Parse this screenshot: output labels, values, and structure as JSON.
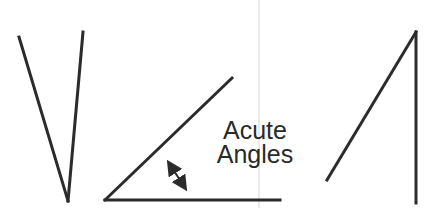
{
  "diagram": {
    "title_lines": [
      "Acute",
      "Angles"
    ],
    "stroke_color": "#2b2b2b",
    "guide_line_color": "#d0d0d0",
    "shapes": [
      {
        "name": "narrow-v-angle",
        "vertex": [
          68,
          201
        ],
        "arms": [
          [
            19,
            37
          ],
          [
            83,
            32
          ]
        ]
      },
      {
        "name": "marked-acute-angle",
        "vertex": [
          105,
          200
        ],
        "arms": [
          [
            232,
            78
          ],
          [
            280,
            200
          ]
        ],
        "arrow": {
          "from": [
            166,
            158
          ],
          "to": [
            188,
            193
          ]
        }
      },
      {
        "name": "tall-acute-angle",
        "vertex": [
          416,
          32
        ],
        "arms": [
          [
            327,
            180
          ],
          [
            416,
            203
          ]
        ]
      }
    ]
  }
}
